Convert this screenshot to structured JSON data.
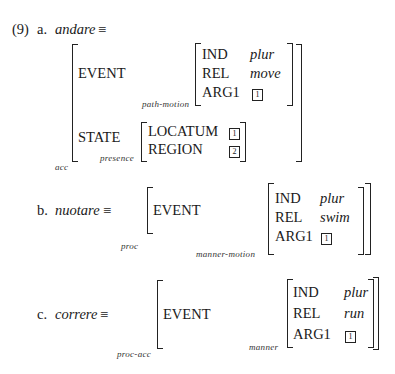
{
  "example_number": "(9)",
  "items": [
    {
      "label": "a.",
      "verb": "andare",
      "equiv": "≡",
      "outer_type": "acc",
      "features": [
        {
          "attr": "EVENT",
          "value_type": "path-motion",
          "value": [
            {
              "attr": "IND",
              "value": "plur"
            },
            {
              "attr": "REL",
              "value": "move"
            },
            {
              "attr": "ARG1",
              "value": "1"
            }
          ]
        },
        {
          "attr": "STATE",
          "value_type": "presence",
          "value": [
            {
              "attr": "LOCATUM",
              "value": "1"
            },
            {
              "attr": "REGION",
              "value": "2"
            }
          ]
        }
      ]
    },
    {
      "label": "b.",
      "verb": "nuotare",
      "equiv": "≡",
      "outer_type": "proc",
      "features": [
        {
          "attr": "EVENT",
          "value_type": "manner-motion",
          "value": [
            {
              "attr": "IND",
              "value": "plur"
            },
            {
              "attr": "REL",
              "value": "swim"
            },
            {
              "attr": "ARG1",
              "value": "1"
            }
          ]
        }
      ]
    },
    {
      "label": "c.",
      "verb": "correre",
      "equiv": "≡",
      "outer_type": "proc-acc",
      "features": [
        {
          "attr": "EVENT",
          "value_type": "manner",
          "value": [
            {
              "attr": "IND",
              "value": "plur"
            },
            {
              "attr": "REL",
              "value": "run"
            },
            {
              "attr": "ARG1",
              "value": "1"
            }
          ]
        }
      ]
    }
  ]
}
